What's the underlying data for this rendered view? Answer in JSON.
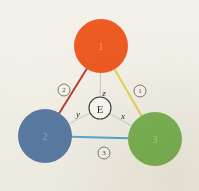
{
  "figure": {
    "background_color": "#f3f1ea",
    "width": 199,
    "height": 191
  },
  "nodes": [
    {
      "id": "node-1",
      "label": "1",
      "color": "#ee5b23",
      "label_color": "#f6a07a",
      "cx": 101,
      "cy": 46,
      "r": 27
    },
    {
      "id": "node-2",
      "label": "2",
      "color": "#5a7ba4",
      "label_color": "#93abc6",
      "cx": 45,
      "cy": 136,
      "r": 27
    },
    {
      "id": "node-3",
      "label": "3",
      "color": "#7cb455",
      "label_color": "#aed392",
      "cx": 155,
      "cy": 139,
      "r": 27
    }
  ],
  "center": {
    "id": "center-node-e",
    "label": "E",
    "cx": 100,
    "cy": 108,
    "r": 11,
    "fill": "#fbfaf5",
    "stroke": "#3a3a38"
  },
  "spokes": [
    {
      "id": "spoke-z",
      "label": "z",
      "from": "center",
      "to": "node-1",
      "color": "#d9c9ae",
      "label_x": 104,
      "label_y": 93
    },
    {
      "id": "spoke-y",
      "label": "y",
      "from": "center",
      "to": "node-2",
      "color": "#cfd9c9",
      "label_x": 78,
      "label_y": 114
    },
    {
      "id": "spoke-x",
      "label": "x",
      "from": "center",
      "to": "node-3",
      "color": "#cfd9c9",
      "label_x": 123,
      "label_y": 116
    }
  ],
  "edges": [
    {
      "id": "edge-1-3",
      "badge": "1",
      "from": "node-1",
      "to": "node-3",
      "color": "#e8d24a",
      "badge_x": 140,
      "badge_y": 91,
      "badge_r": 6
    },
    {
      "id": "edge-1-2",
      "badge": "2",
      "from": "node-1",
      "to": "node-2",
      "color": "#c0392b",
      "badge_x": 64,
      "badge_y": 90,
      "badge_r": 6
    },
    {
      "id": "edge-2-3",
      "badge": "3",
      "from": "node-2",
      "to": "node-3",
      "color": "#57a8d8",
      "badge_x": 104,
      "badge_y": 153,
      "badge_r": 6
    }
  ]
}
